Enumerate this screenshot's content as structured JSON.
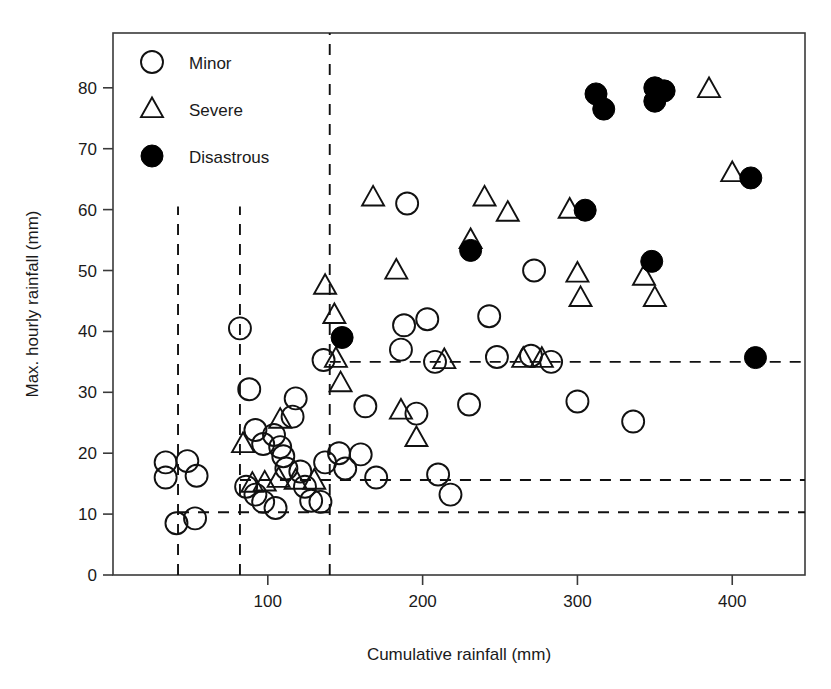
{
  "chart_data": {
    "type": "scatter",
    "title": "",
    "xlabel": "Cumulative rainfall (mm)",
    "ylabel": "Max. hourly rainfall (mm)",
    "xlim": [
      0,
      447
    ],
    "ylim": [
      0,
      89
    ],
    "xticks": [
      100,
      200,
      300,
      400
    ],
    "yticks": [
      0,
      10,
      20,
      30,
      40,
      50,
      60,
      70,
      80
    ],
    "grid": false,
    "legend_position": "top-left",
    "legend": [
      {
        "key": "minor",
        "label": "Minor",
        "marker": "open-circle"
      },
      {
        "key": "severe",
        "label": "Severe",
        "marker": "open-triangle"
      },
      {
        "key": "disastrous",
        "label": "Disastrous",
        "marker": "filled-circle"
      }
    ],
    "series": [
      {
        "name": "Minor",
        "marker": "open-circle",
        "points": [
          [
            34,
            18.5
          ],
          [
            48,
            18.7
          ],
          [
            54,
            16.3
          ],
          [
            34,
            16.0
          ],
          [
            41,
            8.5
          ],
          [
            53,
            9.3
          ],
          [
            82,
            40.5
          ],
          [
            88,
            30.5
          ],
          [
            92,
            23.8
          ],
          [
            97,
            21.5
          ],
          [
            86,
            14.5
          ],
          [
            92,
            13.2
          ],
          [
            97,
            12.0
          ],
          [
            105,
            11.0
          ],
          [
            104,
            23.0
          ],
          [
            108,
            21.0
          ],
          [
            110,
            19.5
          ],
          [
            112,
            17.5
          ],
          [
            118,
            29.0
          ],
          [
            116,
            26.0
          ],
          [
            121,
            17.0
          ],
          [
            124,
            14.5
          ],
          [
            128,
            12.2
          ],
          [
            134,
            12.0
          ],
          [
            137,
            18.5
          ],
          [
            136,
            35.3
          ],
          [
            146,
            20.0
          ],
          [
            150,
            17.5
          ],
          [
            160,
            19.8
          ],
          [
            163,
            27.7
          ],
          [
            170,
            16.0
          ],
          [
            190,
            61.0
          ],
          [
            188,
            41.0
          ],
          [
            186,
            37.0
          ],
          [
            196,
            26.5
          ],
          [
            203,
            42.0
          ],
          [
            208,
            35.0
          ],
          [
            210,
            16.5
          ],
          [
            218,
            13.2
          ],
          [
            230,
            28.0
          ],
          [
            243,
            42.5
          ],
          [
            248,
            35.8
          ],
          [
            270,
            36.0
          ],
          [
            272,
            50.0
          ],
          [
            283,
            35.0
          ],
          [
            300,
            28.5
          ],
          [
            336,
            25.2
          ]
        ]
      },
      {
        "name": "Severe",
        "marker": "open-triangle",
        "points": [
          [
            84,
            21.5
          ],
          [
            90,
            15.0
          ],
          [
            98,
            15.2
          ],
          [
            108,
            25.5
          ],
          [
            107,
            15.8
          ],
          [
            118,
            15.5
          ],
          [
            130,
            15.5
          ],
          [
            137,
            47.5
          ],
          [
            143,
            42.7
          ],
          [
            144,
            35.5
          ],
          [
            147,
            31.5
          ],
          [
            168,
            62.0
          ],
          [
            183,
            50.0
          ],
          [
            186,
            27.0
          ],
          [
            196,
            22.5
          ],
          [
            214,
            35.3
          ],
          [
            231,
            55.0
          ],
          [
            240,
            62.0
          ],
          [
            255,
            59.5
          ],
          [
            265,
            35.5
          ],
          [
            277,
            35.5
          ],
          [
            295,
            60.0
          ],
          [
            300,
            49.5
          ],
          [
            302,
            45.5
          ],
          [
            343,
            49.0
          ],
          [
            350,
            45.5
          ],
          [
            385,
            79.8
          ],
          [
            400,
            66.0
          ]
        ]
      },
      {
        "name": "Disastrous",
        "marker": "filled-circle",
        "points": [
          [
            148,
            39.0
          ],
          [
            231,
            53.3
          ],
          [
            305,
            59.9
          ],
          [
            312,
            79.0
          ],
          [
            317,
            76.5
          ],
          [
            350,
            80.0
          ],
          [
            350,
            77.8
          ],
          [
            356,
            79.5
          ],
          [
            348,
            51.5
          ],
          [
            412,
            65.2
          ],
          [
            415,
            35.7
          ]
        ]
      }
    ],
    "reference_lines": {
      "vertical": [
        {
          "x": 42,
          "y_from": 0,
          "y_to": 60.5
        },
        {
          "x": 82,
          "y_from": 0,
          "y_to": 60.5
        },
        {
          "x": 140,
          "y_from": 0,
          "y_to": 89
        }
      ],
      "horizontal": [
        {
          "y": 35.0,
          "x_from": 140,
          "x_to": 447
        },
        {
          "y": 15.6,
          "x_from": 82,
          "x_to": 447
        },
        {
          "y": 10.3,
          "x_from": 42,
          "x_to": 447
        }
      ]
    }
  },
  "colors": {
    "marker_stroke": "#111111",
    "filled_marker": "#000000",
    "axis": "#3a3a3a",
    "background": "#ffffff"
  }
}
